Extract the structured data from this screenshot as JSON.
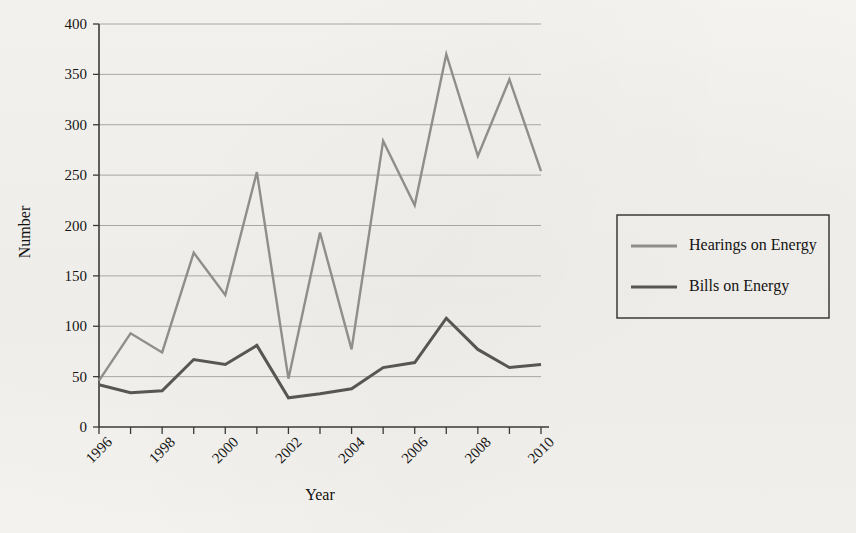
{
  "chart_data": {
    "type": "line",
    "title": "",
    "xlabel": "Year",
    "ylabel": "Number",
    "grid": "horizontal",
    "legend_position": "right",
    "xlim": [
      1996,
      2010
    ],
    "ylim": [
      0,
      400
    ],
    "ytick_step": 50,
    "x": [
      1996,
      1997,
      1998,
      1999,
      2000,
      2001,
      2002,
      2003,
      2004,
      2005,
      2006,
      2007,
      2008,
      2009,
      2010
    ],
    "xtick_labels": [
      "1996",
      "1998",
      "2000",
      "2002",
      "2004",
      "2006",
      "2008",
      "2010"
    ],
    "xtick_values": [
      1996,
      1998,
      2000,
      2002,
      2004,
      2006,
      2008,
      2010
    ],
    "ytick_labels": [
      "0",
      "50",
      "100",
      "150",
      "200",
      "250",
      "300",
      "350",
      "400"
    ],
    "ytick_values": [
      0,
      50,
      100,
      150,
      200,
      250,
      300,
      350,
      400
    ],
    "series": [
      {
        "name": "Hearings on Energy",
        "color": "#8e8e8a",
        "width": 2.4,
        "values": [
          46,
          93,
          74,
          173,
          131,
          253,
          48,
          193,
          77,
          284,
          220,
          370,
          269,
          345,
          254
        ]
      },
      {
        "name": "Bills on Energy",
        "color": "#565652",
        "width": 3.0,
        "values": [
          42,
          34,
          36,
          67,
          62,
          81,
          29,
          33,
          38,
          59,
          64,
          108,
          77,
          59,
          62
        ]
      }
    ]
  },
  "legend": {
    "items": [
      {
        "label": "Hearings on Energy"
      },
      {
        "label": "Bills on Energy"
      }
    ]
  },
  "axes": {
    "y_title": "Number",
    "x_title": "Year"
  },
  "page_artifacts": {
    "ghost_caption": "",
    "ghost_line_1": "",
    "ghost_line_2": ""
  }
}
